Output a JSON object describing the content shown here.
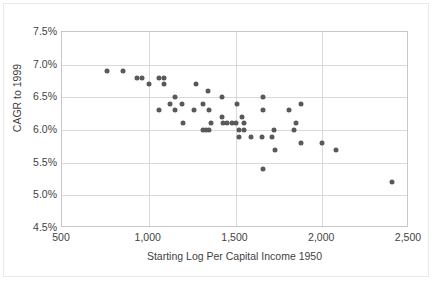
{
  "chart_data": {
    "type": "scatter",
    "title": "",
    "xlabel": "Starting Log Per Capital Income 1950",
    "ylabel": "CAGR to 1999",
    "xlim": [
      500,
      2500
    ],
    "ylim": [
      0.045,
      0.075
    ],
    "xticks": [
      500,
      1000,
      1500,
      2000,
      2500
    ],
    "xticklabels": [
      "500",
      "1,000",
      "1,500",
      "2,000",
      "2,500"
    ],
    "yticks": [
      0.045,
      0.05,
      0.055,
      0.06,
      0.065,
      0.07,
      0.075
    ],
    "yticklabels": [
      "4.5%",
      "5.0%",
      "5.5%",
      "6.0%",
      "6.5%",
      "7.0%",
      "7.5%"
    ],
    "grid": true,
    "legend": false,
    "marker_color": "#595959",
    "gridline_color": "#d9d9d9",
    "plot_border_color": "#c8c8c8",
    "points": [
      [
        760,
        0.069
      ],
      [
        850,
        0.069
      ],
      [
        930,
        0.068
      ],
      [
        960,
        0.068
      ],
      [
        1000,
        0.067
      ],
      [
        1060,
        0.068
      ],
      [
        1090,
        0.068
      ],
      [
        1090,
        0.067
      ],
      [
        1060,
        0.063
      ],
      [
        1120,
        0.064
      ],
      [
        1150,
        0.065
      ],
      [
        1150,
        0.063
      ],
      [
        1190,
        0.064
      ],
      [
        1200,
        0.061
      ],
      [
        1270,
        0.067
      ],
      [
        1260,
        0.063
      ],
      [
        1310,
        0.064
      ],
      [
        1340,
        0.066
      ],
      [
        1350,
        0.063
      ],
      [
        1310,
        0.06
      ],
      [
        1330,
        0.06
      ],
      [
        1350,
        0.06
      ],
      [
        1360,
        0.061
      ],
      [
        1420,
        0.065
      ],
      [
        1420,
        0.062
      ],
      [
        1430,
        0.061
      ],
      [
        1450,
        0.061
      ],
      [
        1480,
        0.061
      ],
      [
        1500,
        0.061
      ],
      [
        1510,
        0.064
      ],
      [
        1520,
        0.06
      ],
      [
        1520,
        0.059
      ],
      [
        1540,
        0.062
      ],
      [
        1550,
        0.061
      ],
      [
        1550,
        0.06
      ],
      [
        1590,
        0.059
      ],
      [
        1650,
        0.059
      ],
      [
        1660,
        0.065
      ],
      [
        1660,
        0.063
      ],
      [
        1660,
        0.054
      ],
      [
        1710,
        0.059
      ],
      [
        1720,
        0.06
      ],
      [
        1730,
        0.057
      ],
      [
        1810,
        0.063
      ],
      [
        1840,
        0.06
      ],
      [
        1850,
        0.061
      ],
      [
        1880,
        0.064
      ],
      [
        1880,
        0.058
      ],
      [
        2000,
        0.058
      ],
      [
        2080,
        0.057
      ],
      [
        2400,
        0.052
      ]
    ]
  }
}
